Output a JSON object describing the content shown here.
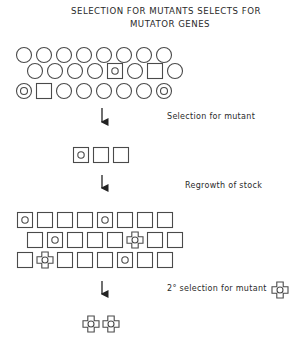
{
  "title": {
    "line1": "SELECTION  FOR MUTANTS  SELECTS FOR",
    "line2": "MUTATOR GENES"
  },
  "steps": [
    {
      "label": "Selection  for  mutant"
    },
    {
      "label": "Regrowth of stock"
    },
    {
      "label": "2°  selection  for  mutant"
    }
  ],
  "legend": {
    "circle": "normal cell",
    "circle-in-circle": "mutator cell",
    "square": "mutant",
    "circle-in-square": "mutant with mutator",
    "cross": "double mutant"
  },
  "population_initial": [
    [
      "circle",
      "circle",
      "circle",
      "circle",
      "circle",
      "circle",
      "circle",
      "circle"
    ],
    [
      "circle",
      "circle",
      "circle",
      "circle",
      "square-circle",
      "circle",
      "square",
      "circle"
    ],
    [
      "circle-circle",
      "square",
      "circle",
      "circle",
      "circle",
      "circle",
      "circle",
      "circle-circle"
    ]
  ],
  "population_selected": [
    "square-circle",
    "square",
    "square"
  ],
  "population_regrown": [
    [
      "square-circle",
      "square",
      "square",
      "square",
      "square-circle",
      "square",
      "square",
      "square"
    ],
    [
      "square",
      "square-circle",
      "square",
      "square",
      "square",
      "cross",
      "square",
      "square"
    ],
    [
      "square",
      "cross",
      "square",
      "square",
      "square",
      "square-circle",
      "square",
      "square"
    ]
  ],
  "population_final": [
    "cross",
    "cross"
  ]
}
